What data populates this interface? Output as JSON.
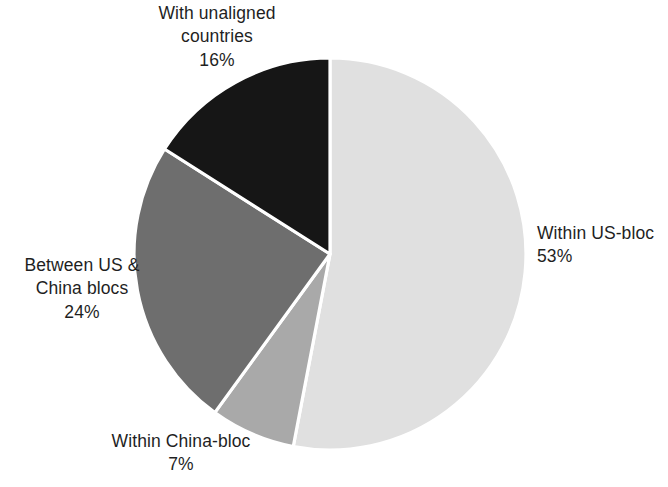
{
  "chart_data": {
    "type": "pie",
    "title": "",
    "subtitle": "",
    "xlabel": "",
    "ylabel": "",
    "legend_position": "none",
    "grid": false,
    "value_unit": "%",
    "start_angle_deg": 0,
    "direction": "clockwise",
    "categories": [
      "Within US-bloc",
      "Within China-bloc",
      "Between US & China blocs",
      "With unaligned countries"
    ],
    "values": [
      53,
      7,
      24,
      16
    ],
    "colors": [
      "#e0e0e0",
      "#a9a9a9",
      "#6e6e6e",
      "#161616"
    ],
    "slice_separator_color": "#ffffff",
    "slices": [
      {
        "label": "Within US-bloc",
        "value": 53,
        "value_text": "53%",
        "color": "#e0e0e0",
        "start_deg": 0,
        "end_deg": 190.8
      },
      {
        "label": "Within China-bloc",
        "value": 7,
        "value_text": "7%",
        "color": "#a9a9a9",
        "start_deg": 190.8,
        "end_deg": 216.0
      },
      {
        "label": "Between US & China blocs",
        "value": 24,
        "value_text": "24%",
        "color": "#6e6e6e",
        "start_deg": 216.0,
        "end_deg": 302.4
      },
      {
        "label": "With unaligned countries",
        "value": 16,
        "value_text": "16%",
        "color": "#161616",
        "start_deg": 302.4,
        "end_deg": 360
      }
    ]
  },
  "labels": {
    "unaligned": {
      "line1": "With unaligned",
      "line2": "countries",
      "value": "16%"
    },
    "between": {
      "line1": "Between US &",
      "line2": "China blocs",
      "value": "24%"
    },
    "china": {
      "line1": "Within China-bloc",
      "line2": "",
      "value": "7%"
    },
    "us": {
      "line1": "Within US-bloc",
      "line2": "",
      "value": "53%"
    }
  },
  "geometry": {
    "center_x": 330,
    "center_y": 254,
    "radius": 196
  }
}
